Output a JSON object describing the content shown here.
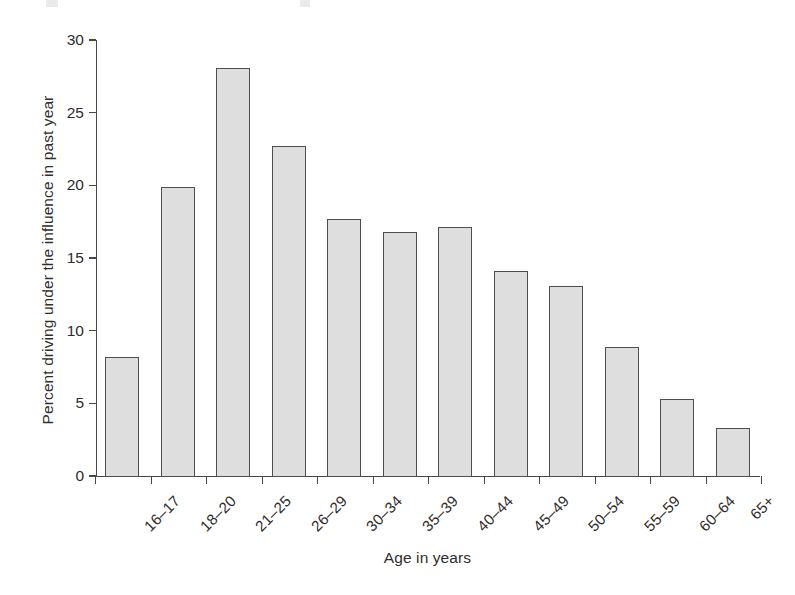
{
  "chart_data": {
    "type": "bar",
    "title": "",
    "xlabel": "Age in years",
    "ylabel": "Percent driving under the influence in past year",
    "categories": [
      "16–17",
      "18–20",
      "21–25",
      "26–29",
      "30–34",
      "35–39",
      "40–44",
      "45–49",
      "50–54",
      "55–59",
      "60–64",
      "65+"
    ],
    "values": [
      8.2,
      19.9,
      28.1,
      22.7,
      17.7,
      16.8,
      17.1,
      14.1,
      13.1,
      8.9,
      5.3,
      3.3
    ],
    "ylim": [
      0,
      30
    ],
    "yticks": [
      0,
      5,
      10,
      15,
      20,
      25,
      30
    ],
    "ytick_labels": [
      "0",
      "5",
      "10",
      "15",
      "20",
      "25",
      "30"
    ],
    "grid": false,
    "legend": false,
    "bar_fill_color": "#dedede",
    "bar_edge_color": "#504d4e",
    "axis_color": "#4a4647",
    "background_color": "#ffffff"
  }
}
